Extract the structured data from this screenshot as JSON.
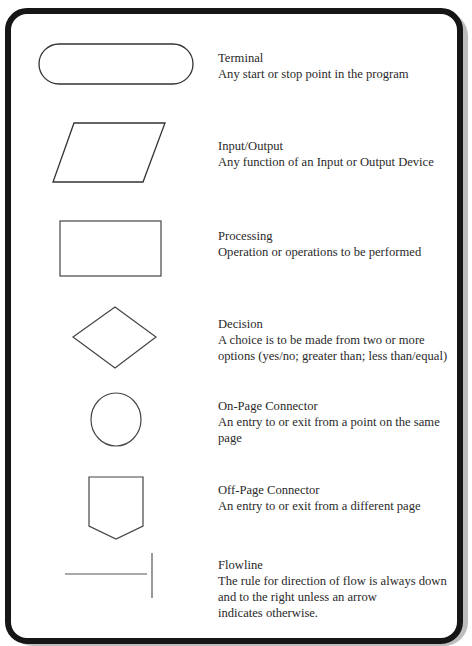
{
  "symbols": [
    {
      "shape": "terminal-icon",
      "title": "Terminal",
      "description": "Any start or stop point in the program"
    },
    {
      "shape": "parallelogram-icon",
      "title": "Input/Output",
      "description": "Any function of an Input or Output Device"
    },
    {
      "shape": "rectangle-icon",
      "title": "Processing",
      "description": "Operation or operations to be performed"
    },
    {
      "shape": "diamond-icon",
      "title": "Decision",
      "description": "A choice is to be made from two or more\noptions (yes/no; greater than; less than/equal)"
    },
    {
      "shape": "circle-icon",
      "title": "On-Page Connector",
      "description": "An entry to or exit from a point on the same\npage"
    },
    {
      "shape": "pentagon-icon",
      "title": "Off-Page Connector",
      "description": "An entry to or exit from a different page"
    },
    {
      "shape": "flowline-icon",
      "title": "Flowline",
      "description": "The rule for direction of flow is always down\nand to the right unless an arrow\nindicates otherwise."
    }
  ],
  "colors": {
    "frame": "#161616",
    "shadow": "#bdbdbd",
    "stroke": "#444444",
    "text": "#2a2a2a"
  }
}
